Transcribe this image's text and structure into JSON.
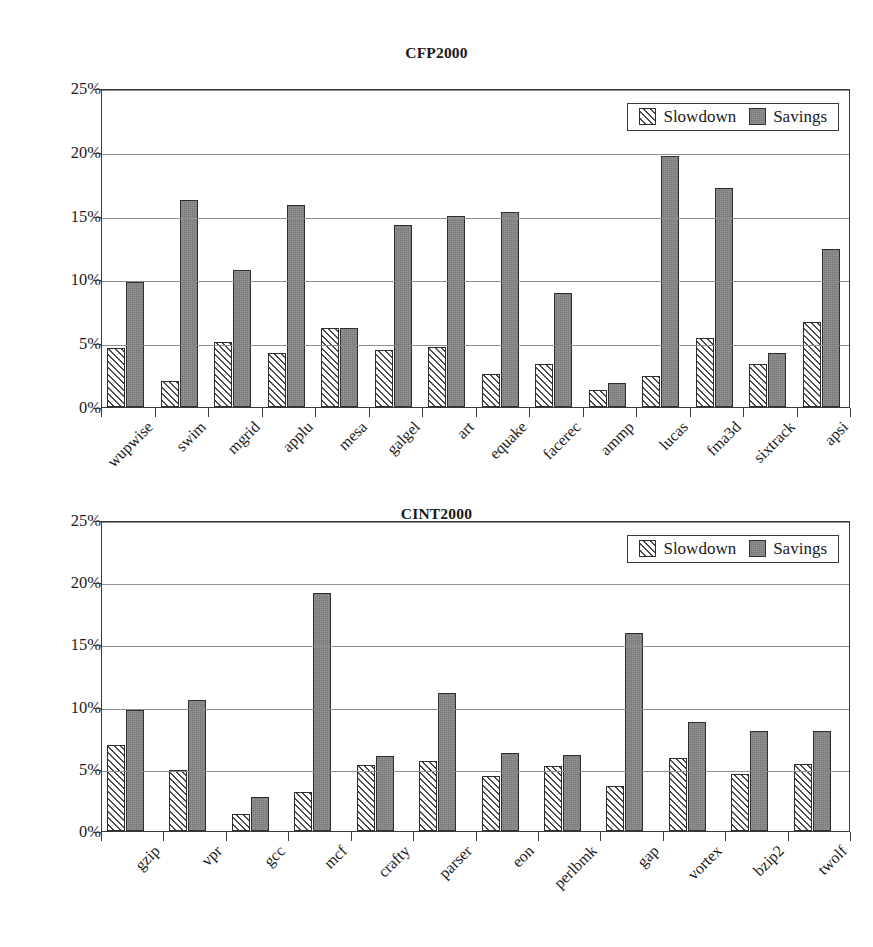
{
  "figure": {
    "legend": {
      "slowdown_label": "Slowdown",
      "savings_label": "Savings"
    },
    "series_colors": {
      "slowdown": "#ffffff",
      "savings": "#797979",
      "outline": "#2e2e2e",
      "gridline": "#8e8e8e"
    }
  },
  "chart_data": [
    {
      "type": "bar",
      "title": "CFP2000",
      "xlabel": "",
      "ylabel": "",
      "ylim": [
        0,
        25
      ],
      "yticks": [
        0,
        5,
        10,
        15,
        20,
        25
      ],
      "ytick_labels": [
        "0%",
        "5%",
        "10%",
        "15%",
        "20%",
        "25%"
      ],
      "grid": true,
      "legend_position": "top-right",
      "legend": [
        "Slowdown",
        "Savings"
      ],
      "categories": [
        "wupwise",
        "swim",
        "mgrid",
        "applu",
        "mesa",
        "galgel",
        "art",
        "equake",
        "facerec",
        "ammp",
        "lucas",
        "fma3d",
        "sixtrack",
        "apsi"
      ],
      "series": [
        {
          "name": "Slowdown",
          "values": [
            4.6,
            2.0,
            5.1,
            4.2,
            6.2,
            4.5,
            4.7,
            2.6,
            3.4,
            1.3,
            2.4,
            5.4,
            3.4,
            6.7
          ]
        },
        {
          "name": "Savings",
          "values": [
            9.8,
            16.2,
            10.7,
            15.8,
            6.2,
            14.3,
            15.0,
            15.3,
            8.9,
            1.9,
            19.7,
            17.2,
            4.2,
            12.4
          ]
        }
      ]
    },
    {
      "type": "bar",
      "title": "CINT2000",
      "xlabel": "",
      "ylabel": "",
      "ylim": [
        0,
        25
      ],
      "yticks": [
        0,
        5,
        10,
        15,
        20,
        25
      ],
      "ytick_labels": [
        "0%",
        "5%",
        "10%",
        "15%",
        "20%",
        "25%"
      ],
      "grid": true,
      "legend_position": "top-right",
      "legend": [
        "Slowdown",
        "Savings"
      ],
      "categories": [
        "gzip",
        "vpr",
        "gcc",
        "mcf",
        "crafty",
        "parser",
        "eon",
        "perlbmk",
        "gap",
        "vortex",
        "bzip2",
        "twolf"
      ],
      "series": [
        {
          "name": "Slowdown",
          "values": [
            6.9,
            4.9,
            1.4,
            3.1,
            5.3,
            5.6,
            4.4,
            5.2,
            3.6,
            5.9,
            4.6,
            5.4
          ]
        },
        {
          "name": "Savings",
          "values": [
            9.7,
            10.5,
            2.7,
            19.1,
            6.0,
            11.1,
            6.3,
            6.1,
            15.9,
            8.8,
            8.0,
            8.0
          ]
        }
      ]
    }
  ]
}
